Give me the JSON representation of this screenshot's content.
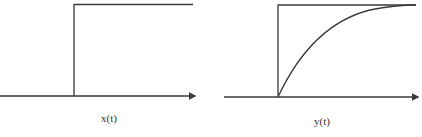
{
  "diagram": {
    "panels": [
      {
        "label": "x(t)",
        "kind": "step"
      },
      {
        "label": "y(t)",
        "kind": "step-with-exponential-rise"
      }
    ],
    "colors": {
      "line": "#3a3a3a",
      "background": "#ffffff"
    }
  }
}
